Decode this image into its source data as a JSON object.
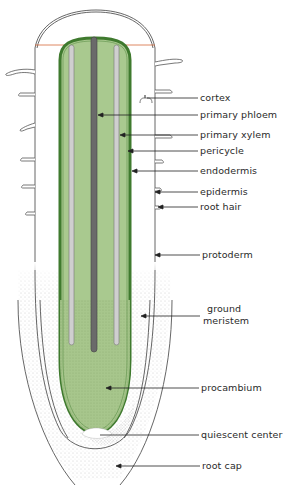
{
  "figure": {
    "colors": {
      "stele_fill": "#a9c98f",
      "stele_border": "#3f7a2e",
      "xylem_gray": "#c8c8c8",
      "phloem_dark": "#6a6a6a",
      "outline": "#555555",
      "stipple": "#9a9a9a",
      "cut_line": "#d66a3a"
    },
    "labels": [
      {
        "id": "cortex",
        "text": "cortex",
        "x": 200,
        "y": 93
      },
      {
        "id": "primary-phloem",
        "text": "primary phloem",
        "x": 200,
        "y": 110
      },
      {
        "id": "primary-xylem",
        "text": "primary xylem",
        "x": 200,
        "y": 130
      },
      {
        "id": "pericycle",
        "text": "pericycle",
        "x": 200,
        "y": 146
      },
      {
        "id": "endodermis",
        "text": "endodermis",
        "x": 200,
        "y": 166
      },
      {
        "id": "epidermis",
        "text": "epidermis",
        "x": 200,
        "y": 187
      },
      {
        "id": "root-hair",
        "text": "root hair",
        "x": 200,
        "y": 202
      },
      {
        "id": "protoderm",
        "text": "protoderm",
        "x": 202,
        "y": 249
      },
      {
        "id": "ground-meristem-1",
        "text": "ground",
        "x": 206,
        "y": 304
      },
      {
        "id": "ground-meristem-2",
        "text": "meristem",
        "x": 203,
        "y": 316
      },
      {
        "id": "procambium",
        "text": "procambium",
        "x": 201,
        "y": 382
      },
      {
        "id": "quiescent-center",
        "text": "quiescent center",
        "x": 201,
        "y": 429
      },
      {
        "id": "root-cap",
        "text": "root cap",
        "x": 202,
        "y": 461
      }
    ]
  }
}
